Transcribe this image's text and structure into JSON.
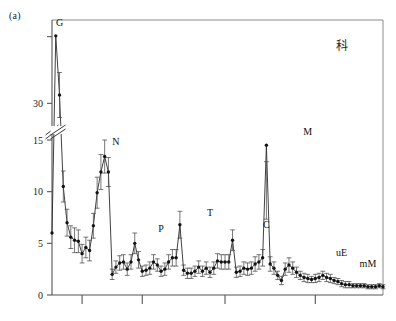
{
  "figure": {
    "panel_label": "(a)",
    "corner_glyph": "科"
  },
  "chart_data": {
    "type": "line",
    "title": "",
    "subtitle": "",
    "xlabel": "",
    "ylabel": "",
    "grid": false,
    "legend": "none",
    "axis_break": {
      "present": true,
      "lower_segment": [
        0,
        15
      ],
      "upper_segment": [
        30,
        40
      ],
      "note": "y-axis broken between 15 and 30"
    },
    "ytick_labels": [
      "0",
      "5",
      "10",
      "15",
      "30"
    ],
    "ytick_values": [
      0,
      5,
      10,
      15,
      30
    ],
    "yticks_unlabeled": [
      38
    ],
    "ylim": [
      0,
      40
    ],
    "xtick_labels": [
      "",
      "",
      "",
      ""
    ],
    "xtick_positions": [
      8,
      24,
      46,
      70
    ],
    "xlim": [
      0,
      88
    ],
    "marker": "filled-circle",
    "error_bars": "vertical",
    "annotations": [
      {
        "text": "G",
        "x": 2,
        "y": 38.2
      },
      {
        "text": "N",
        "x": 17,
        "y": 13.6
      },
      {
        "text": "P",
        "x": 29,
        "y": 5.2
      },
      {
        "text": "T",
        "x": 42,
        "y": 6.8
      },
      {
        "text": "C",
        "x": 57,
        "y": 5.6
      },
      {
        "text": "M",
        "x": 68,
        "y": 14.6
      },
      {
        "text": "uE",
        "x": 77,
        "y": 2.9
      },
      {
        "text": "mM",
        "x": 84,
        "y": 1.8
      }
    ],
    "x": [
      0,
      1,
      2,
      3,
      4,
      5,
      6,
      7,
      8,
      9,
      10,
      11,
      12,
      13,
      14,
      15,
      16,
      17,
      18,
      19,
      20,
      21,
      22,
      23,
      24,
      25,
      26,
      27,
      28,
      29,
      30,
      31,
      32,
      33,
      34,
      35,
      36,
      37,
      38,
      39,
      40,
      41,
      42,
      43,
      44,
      45,
      46,
      47,
      48,
      49,
      50,
      51,
      52,
      53,
      54,
      55,
      56,
      57,
      58,
      59,
      60,
      61,
      62,
      63,
      64,
      65,
      66,
      67,
      68,
      69,
      70,
      71,
      72,
      73,
      74,
      75,
      76,
      77,
      78,
      79,
      80,
      81,
      82,
      83,
      84,
      85,
      86,
      87,
      88
    ],
    "values": [
      6.0,
      38.1,
      31.0,
      10.5,
      7.0,
      5.6,
      5.3,
      5.2,
      4.0,
      4.6,
      4.3,
      6.7,
      9.9,
      11.9,
      13.4,
      11.9,
      2.0,
      2.7,
      3.1,
      3.2,
      2.5,
      3.2,
      5.0,
      3.4,
      2.3,
      2.4,
      2.6,
      3.2,
      2.9,
      2.3,
      2.5,
      3.2,
      3.6,
      3.6,
      6.8,
      2.4,
      2.1,
      2.1,
      2.3,
      2.7,
      2.3,
      2.6,
      2.2,
      2.6,
      3.3,
      3.2,
      3.2,
      3.2,
      5.3,
      2.2,
      2.3,
      2.6,
      2.5,
      2.6,
      3.0,
      3.2,
      3.6,
      14.5,
      3.0,
      2.6,
      1.9,
      1.4,
      2.5,
      2.9,
      2.6,
      2.2,
      1.9,
      1.7,
      1.6,
      1.5,
      1.6,
      1.7,
      1.9,
      1.7,
      1.6,
      1.4,
      1.3,
      1.1,
      1.0,
      1.0,
      0.9,
      0.9,
      0.9,
      0.9,
      0.8,
      0.8,
      0.8,
      0.9,
      0.8
    ],
    "errors": [
      0.0,
      0.0,
      2.7,
      1.5,
      1.3,
      1.1,
      1.2,
      1.1,
      0.9,
      1.0,
      1.0,
      1.2,
      1.5,
      1.7,
      1.6,
      1.4,
      0.5,
      0.6,
      0.7,
      0.7,
      0.6,
      0.7,
      1.0,
      0.8,
      0.5,
      0.5,
      0.6,
      0.7,
      0.6,
      0.5,
      0.6,
      0.7,
      0.8,
      0.8,
      1.3,
      0.5,
      0.5,
      0.5,
      0.5,
      0.6,
      0.5,
      0.6,
      0.5,
      0.6,
      0.7,
      0.7,
      0.7,
      0.7,
      1.0,
      0.5,
      0.5,
      0.6,
      0.6,
      0.6,
      0.7,
      0.7,
      0.8,
      1.6,
      0.7,
      0.6,
      0.4,
      0.4,
      0.6,
      0.7,
      0.6,
      0.5,
      0.4,
      0.4,
      0.4,
      0.3,
      0.4,
      0.4,
      0.4,
      0.4,
      0.4,
      0.3,
      0.3,
      0.3,
      0.3,
      0.3,
      0.2,
      0.2,
      0.2,
      0.2,
      0.2,
      0.2,
      0.2,
      0.2,
      0.2
    ]
  }
}
